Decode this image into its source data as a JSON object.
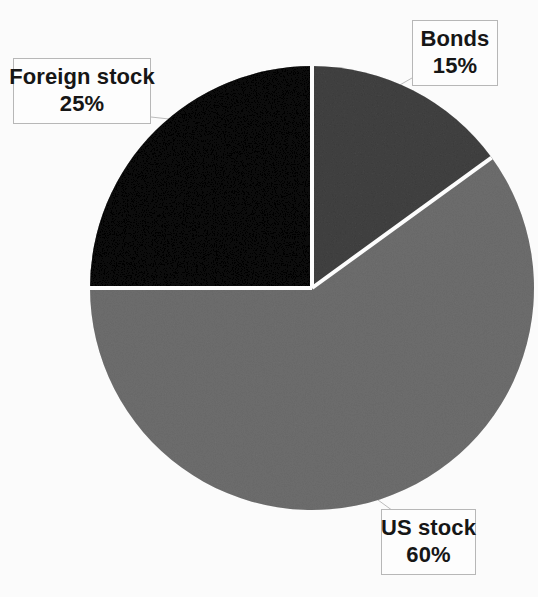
{
  "chart_data": {
    "type": "pie",
    "title": "",
    "subtitle": "",
    "xlabel": "",
    "ylabel": "",
    "legend_position": "none",
    "grid": false,
    "labels_as_callouts": true,
    "start_angle_deg": 0,
    "direction": "clockwise",
    "total": 100,
    "unit": "%",
    "categories": [
      "Bonds",
      "US stock",
      "Foreign stock"
    ],
    "values": [
      15,
      60,
      25
    ],
    "slices": [
      {
        "name": "Bonds",
        "value": 15,
        "value_text": "15%",
        "color": "#808080",
        "start_deg": 0,
        "sweep_deg": 54
      },
      {
        "name": "US stock",
        "value": 60,
        "value_text": "60%",
        "color": "#a6a6a6",
        "start_deg": 54,
        "sweep_deg": 216
      },
      {
        "name": "Foreign stock",
        "value": 25,
        "value_text": "25%",
        "color": "#333333",
        "start_deg": 270,
        "sweep_deg": 90
      }
    ]
  },
  "callouts": {
    "bonds": {
      "name": "Bonds",
      "value_text": "15%"
    },
    "us_stock": {
      "name": "US stock",
      "value_text": "60%"
    },
    "foreign_stock": {
      "name": "Foreign stock",
      "value_text": "25%"
    }
  },
  "colors": {
    "bonds": "#808080",
    "us_stock": "#a6a6a6",
    "foreign_stock": "#333333",
    "slice_divider": "#ffffff",
    "callout_border": "#b9b9b9",
    "callout_background": "#ffffff",
    "text": "#171717",
    "leader_line": "#b9b9b9",
    "page_background": "#fdfdfd"
  }
}
